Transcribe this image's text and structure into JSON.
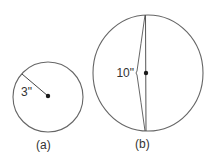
{
  "figure": {
    "colors": {
      "stroke": "#666666",
      "dot": "#1a1a1a",
      "text": "#333333",
      "background": "#ffffff"
    },
    "circle_a": {
      "caption": "(a)",
      "measure_label": "3\"",
      "measure_type": "radius"
    },
    "circle_b": {
      "caption": "(b)",
      "measure_label": "10\"",
      "measure_type": "diameter"
    }
  }
}
